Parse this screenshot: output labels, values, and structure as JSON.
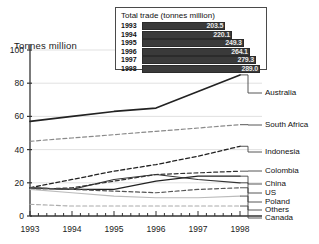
{
  "chart_data": {
    "type": "line",
    "title": "",
    "xlabel": "",
    "ylabel": "Tonnes million",
    "x": [
      1993,
      1994,
      1995,
      1996,
      1997,
      1998
    ],
    "xlim": [
      1993,
      1998
    ],
    "ylim": [
      0,
      100
    ],
    "yticks": [
      0,
      20,
      40,
      60,
      80,
      100
    ],
    "xticks": [
      "1993",
      "1994",
      "1995",
      "1996",
      "1997",
      "1998"
    ],
    "grid": true,
    "legend_position": "right",
    "series": [
      {
        "name": "Australia",
        "style": "solid",
        "color": "#222222",
        "width": 1.6,
        "values": [
          57,
          60,
          63,
          65,
          75,
          85
        ]
      },
      {
        "name": "South Africa",
        "style": "dashed",
        "color": "#8a8a8a",
        "width": 1.2,
        "values": [
          45,
          47,
          49,
          51,
          53,
          55
        ]
      },
      {
        "name": "Indonesia",
        "style": "dashed",
        "color": "#222222",
        "width": 1.3,
        "values": [
          17,
          22,
          27,
          31,
          36,
          42
        ]
      },
      {
        "name": "Colombia",
        "style": "dashed",
        "color": "#333333",
        "width": 1.2,
        "values": [
          16,
          17,
          21,
          25,
          26,
          27
        ]
      },
      {
        "name": "China",
        "style": "solid",
        "color": "#222222",
        "width": 1.3,
        "values": [
          17,
          16,
          16,
          21,
          24,
          24
        ]
      },
      {
        "name": "US",
        "style": "solid",
        "color": "#333333",
        "width": 1.2,
        "values": [
          17,
          16,
          22,
          25,
          22,
          20
        ]
      },
      {
        "name": "Poland",
        "style": "dashed",
        "color": "#555555",
        "width": 1.2,
        "values": [
          17,
          16,
          15,
          14,
          16,
          17
        ]
      },
      {
        "name": "Others",
        "style": "solid",
        "color": "#bbbbbb",
        "width": 1.2,
        "values": [
          16,
          14,
          12,
          11,
          11,
          12
        ]
      },
      {
        "name": "Canada",
        "style": "dashed",
        "color": "#aaaaaa",
        "width": 1.1,
        "values": [
          7,
          6,
          6,
          6,
          6,
          6
        ]
      }
    ]
  },
  "inset": {
    "title": "Total trade (tonnes million)",
    "max_value": 289.0,
    "rows": [
      {
        "year": "1993",
        "value": "203.5",
        "num": 203.5
      },
      {
        "year": "1994",
        "value": "220.1",
        "num": 220.1
      },
      {
        "year": "1995",
        "value": "249.3",
        "num": 249.3
      },
      {
        "year": "1996",
        "value": "264.1",
        "num": 264.1
      },
      {
        "year": "1997",
        "value": "279.3",
        "num": 279.3
      },
      {
        "year": "1998",
        "value": "289.0",
        "num": 289.0
      }
    ]
  },
  "colors": {
    "grid": "#d9d9d9",
    "axis": "#333333",
    "background": "#ffffff"
  }
}
